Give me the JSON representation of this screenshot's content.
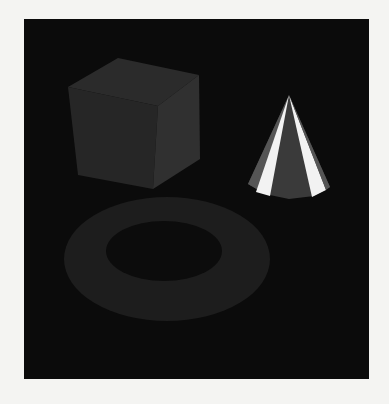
{
  "scene": {
    "description": "Rendered 3D scene: shaded cube, torus, and faceted cone on black background",
    "background_color": "#0b0b0b",
    "page_color": "#f4f4f2",
    "objects": [
      {
        "name": "cube",
        "colors": {
          "top": "#2a2a2a",
          "left": "#252525",
          "right": "#2e2e2e"
        }
      },
      {
        "name": "torus",
        "colors": {
          "body": "#1d1d1d",
          "hole": "#0c0c0c"
        }
      },
      {
        "name": "cone",
        "colors": {
          "dark_facet": "#3a3a3a",
          "highlight": "#f2f2f2",
          "edge": "#555555"
        }
      }
    ]
  }
}
